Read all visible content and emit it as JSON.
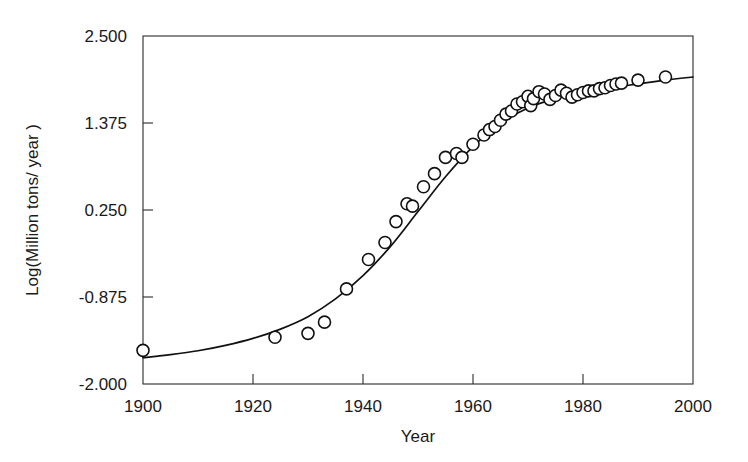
{
  "chart_data": {
    "type": "scatter",
    "title": "",
    "subtitle": "",
    "xlabel": "Year",
    "ylabel": "Log(Million tons/ year )",
    "xlim": [
      1900,
      2000
    ],
    "ylim": [
      -2.0,
      2.5
    ],
    "xticks": [
      1900,
      1920,
      1940,
      1960,
      1980,
      2000
    ],
    "xtick_labels": [
      "1900",
      "1920",
      "1940",
      "1960",
      "1980",
      "2000"
    ],
    "yticks": [
      -2.0,
      -0.875,
      0.25,
      1.375,
      2.5
    ],
    "ytick_labels": [
      "-2.000",
      "-0.875",
      "0.250",
      "1.375",
      "2.500"
    ],
    "grid": false,
    "legend": null,
    "marker_style": "open-circle",
    "series": [
      {
        "name": "observations",
        "marker": "open-circle",
        "x": [
          1900,
          1924,
          1930,
          1933,
          1937,
          1941,
          1944,
          1946,
          1948,
          1949,
          1951,
          1953,
          1955,
          1957,
          1958,
          1960,
          1962,
          1963,
          1964,
          1965,
          1966,
          1967,
          1968,
          1969,
          1970,
          1970.5,
          1971,
          1972,
          1973,
          1974,
          1975,
          1976,
          1977,
          1978,
          1979,
          1980,
          1981,
          1982,
          1983,
          1984,
          1985,
          1986,
          1987,
          1990,
          1995
        ],
        "y": [
          -1.565,
          -1.395,
          -1.345,
          -1.2,
          -0.77,
          -0.39,
          -0.17,
          0.1,
          0.33,
          0.3,
          0.55,
          0.72,
          0.93,
          0.98,
          0.93,
          1.1,
          1.22,
          1.29,
          1.33,
          1.41,
          1.49,
          1.53,
          1.62,
          1.65,
          1.72,
          1.6,
          1.69,
          1.78,
          1.75,
          1.68,
          1.73,
          1.8,
          1.76,
          1.71,
          1.74,
          1.77,
          1.79,
          1.79,
          1.82,
          1.83,
          1.86,
          1.88,
          1.89,
          1.93,
          1.97
        ]
      }
    ],
    "fit_curve": {
      "name": "logistic fit",
      "model": "logistic",
      "x": [
        1900,
        1905,
        1910,
        1915,
        1920,
        1925,
        1930,
        1935,
        1940,
        1945,
        1950,
        1955,
        1960,
        1965,
        1970,
        1975,
        1980,
        1985,
        1990,
        1995,
        2000
      ],
      "y": [
        -1.66,
        -1.62,
        -1.57,
        -1.5,
        -1.41,
        -1.29,
        -1.13,
        -0.9,
        -0.6,
        -0.22,
        0.23,
        0.68,
        1.07,
        1.37,
        1.57,
        1.69,
        1.77,
        1.83,
        1.88,
        1.93,
        1.97
      ]
    }
  },
  "axes": {
    "x_title": "Year",
    "y_title": "Log(Million tons/ year )"
  }
}
